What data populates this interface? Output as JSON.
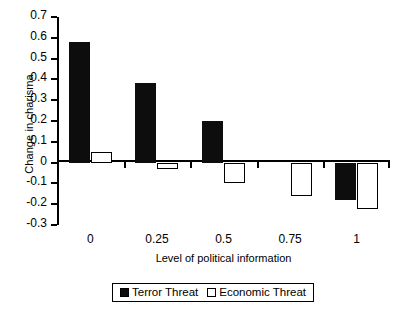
{
  "chart_data": {
    "type": "bar",
    "title": "",
    "xlabel": "Level of political information",
    "ylabel": "Change in charisma",
    "categories": [
      "0",
      "0.25",
      "0.5",
      "0.75",
      "1"
    ],
    "series": [
      {
        "name": "Terror Threat",
        "color": "#0d0d0d",
        "values": [
          0.58,
          0.385,
          0.2,
          0.0,
          -0.18
        ]
      },
      {
        "name": "Economic Threat",
        "color": "#ffffff",
        "values": [
          0.05,
          -0.03,
          -0.1,
          -0.16,
          -0.225
        ]
      }
    ],
    "ylim": [
      -0.3,
      0.7
    ],
    "ytick_labels": [
      "0.7",
      "0.6",
      "0.5",
      "0.4",
      "0.3",
      "0.2",
      "0.1",
      "0",
      "-0.1",
      "-0.2",
      "-0.3"
    ],
    "ytick_values": [
      0.7,
      0.6,
      0.5,
      0.4,
      0.3,
      0.2,
      0.1,
      0,
      -0.1,
      -0.2,
      -0.3
    ],
    "grid": false,
    "legend_position": "bottom"
  },
  "legend": {
    "entries": [
      {
        "label": "Terror Threat",
        "swatch": "filled-black-square"
      },
      {
        "label": "Economic Threat",
        "swatch": "open-white-square"
      }
    ]
  }
}
